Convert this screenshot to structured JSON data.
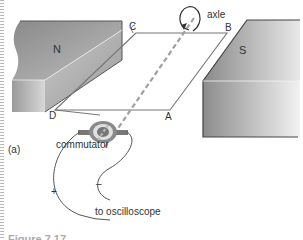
{
  "figure": {
    "panel_label": "(a)",
    "magnets": {
      "north_label": "N",
      "south_label": "S"
    },
    "coil_corners": {
      "a": "A",
      "b": "B",
      "c": "C",
      "d": "D"
    },
    "axle_label": "axle",
    "commutator_label": "commutator",
    "polarity": {
      "positive": "+",
      "negative": "–"
    },
    "output_label": "to oscilloscope",
    "caption_partial": "Figure 7.17"
  },
  "colors": {
    "magnet_dark": "#7a7a7a",
    "magnet_light": "#d8d8d8",
    "wire": "#666666",
    "axle_dash": "#a0a0a0"
  }
}
